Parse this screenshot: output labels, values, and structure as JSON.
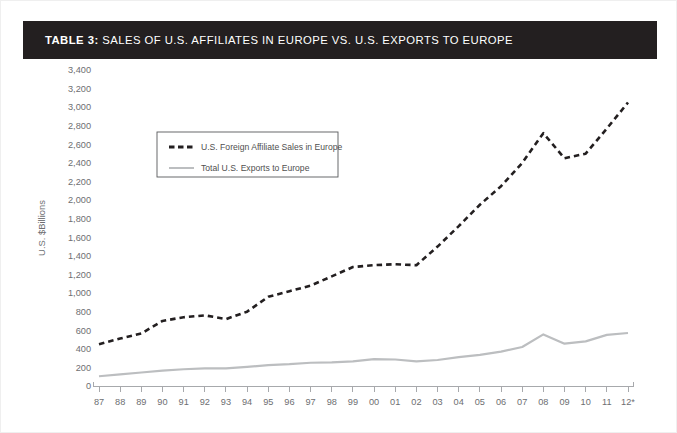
{
  "title": {
    "prefix": "TABLE 3:",
    "text": " SALES OF U.S. AFFILIATES IN EUROPE VS. U.S. EXPORTS TO EUROPE",
    "background": "#231f20",
    "color": "#ffffff"
  },
  "legend": {
    "items": [
      {
        "label": "U.S. Foreign Affiliate Sales in Europe",
        "style": "dashed",
        "color": "#231f20"
      },
      {
        "label": "Total U.S. Exports to Europe",
        "style": "solid",
        "color": "#bcbec0"
      }
    ]
  },
  "chart_data": {
    "type": "line",
    "title": "SALES OF U.S. AFFILIATES IN EUROPE VS. U.S. EXPORTS TO EUROPE",
    "xlabel": "",
    "ylabel": "U.S. $Billions",
    "ylim": [
      0,
      3400
    ],
    "ytick_step": 200,
    "yticks": [
      0,
      200,
      400,
      600,
      800,
      1000,
      1200,
      1400,
      1600,
      1800,
      2000,
      2200,
      2400,
      2600,
      2800,
      3000,
      3200,
      3400
    ],
    "ytick_labels": [
      "0",
      "200",
      "400",
      "600",
      "800",
      "1,000",
      "1,200",
      "1,400",
      "1,600",
      "1,800",
      "2,000",
      "2,200",
      "2,400",
      "2,600",
      "2,800",
      "3,000",
      "3,200",
      "3,400"
    ],
    "categories": [
      "87",
      "88",
      "89",
      "90",
      "91",
      "92",
      "93",
      "94",
      "95",
      "96",
      "97",
      "98",
      "99",
      "00",
      "01",
      "02",
      "03",
      "04",
      "05",
      "06",
      "07",
      "08",
      "09",
      "10",
      "11",
      "12*"
    ],
    "grid": false,
    "legend_position": "upper-left-inset",
    "series": [
      {
        "name": "U.S. Foreign Affiliate Sales in Europe",
        "style": "dashed",
        "color": "#231f20",
        "values": [
          450,
          510,
          565,
          700,
          740,
          760,
          720,
          800,
          960,
          1020,
          1080,
          1180,
          1280,
          1300,
          1310,
          1300,
          1500,
          1720,
          1950,
          2150,
          2400,
          2720,
          2450,
          2500,
          2770,
          3050
        ]
      },
      {
        "name": "Total U.S. Exports to Europe",
        "style": "solid",
        "color": "#bcbec0",
        "values": [
          105,
          125,
          145,
          165,
          180,
          190,
          190,
          205,
          225,
          235,
          250,
          255,
          265,
          290,
          285,
          265,
          280,
          310,
          335,
          370,
          420,
          555,
          455,
          480,
          550,
          570
        ]
      }
    ]
  }
}
